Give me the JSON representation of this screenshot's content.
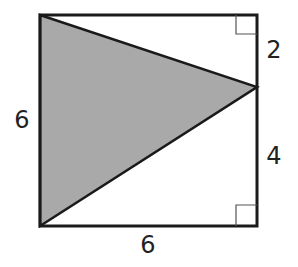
{
  "diagram": {
    "type": "geometry-figure",
    "square": {
      "side_length": 6
    },
    "triangle": {
      "fill": "#a9a9a9",
      "vertices": [
        "top-left",
        "right-side point",
        "bottom-left"
      ]
    },
    "labels": {
      "left": "6",
      "bottom": "6",
      "right_upper": "2",
      "right_lower": "4"
    },
    "right_angle_marks": [
      "top-right",
      "bottom-right"
    ],
    "colors": {
      "stroke": "#1a1a1a",
      "shade": "#a9a9a9",
      "background": "#ffffff"
    }
  }
}
